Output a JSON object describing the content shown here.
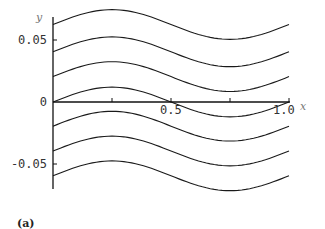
{
  "chart_data": {
    "type": "line",
    "title": "",
    "panel_label": "(a)",
    "xlabel": "x",
    "ylabel": "y",
    "xlim": [
      0,
      1.0
    ],
    "ylim": [
      -0.07,
      0.07
    ],
    "x_ticks": [
      {
        "value": 0.5,
        "label": "0.5"
      },
      {
        "value": 1.0,
        "label": "1.0"
      }
    ],
    "y_ticks": [
      {
        "value": 0.05,
        "label": "0.05"
      },
      {
        "value": 0,
        "label": "0"
      },
      {
        "value": -0.05,
        "label": "-0.05"
      }
    ],
    "grid": false,
    "legend": null,
    "series": [
      {
        "name": "curve-1",
        "y0": 0.0625,
        "x": [
          0,
          0.25,
          0.5,
          0.75,
          1.0
        ],
        "y": [
          0.0625,
          0.0745,
          0.0625,
          0.0505,
          0.0625
        ]
      },
      {
        "name": "curve-2",
        "y0": 0.0405,
        "x": [
          0,
          0.25,
          0.5,
          0.75,
          1.0
        ],
        "y": [
          0.0405,
          0.0525,
          0.0405,
          0.0285,
          0.0405
        ]
      },
      {
        "name": "curve-3",
        "y0": 0.0205,
        "x": [
          0,
          0.25,
          0.5,
          0.75,
          1.0
        ],
        "y": [
          0.0205,
          0.0325,
          0.0205,
          0.0085,
          0.0205
        ]
      },
      {
        "name": "curve-4",
        "y0": 0.0,
        "x": [
          0,
          0.25,
          0.5,
          0.75,
          1.0
        ],
        "y": [
          0.0,
          0.012,
          0.0,
          -0.012,
          0.0
        ]
      },
      {
        "name": "curve-5",
        "y0": -0.0195,
        "x": [
          0,
          0.25,
          0.5,
          0.75,
          1.0
        ],
        "y": [
          -0.0195,
          -0.0075,
          -0.0195,
          -0.0315,
          -0.0195
        ]
      },
      {
        "name": "curve-6",
        "y0": -0.0395,
        "x": [
          0,
          0.25,
          0.5,
          0.75,
          1.0
        ],
        "y": [
          -0.0395,
          -0.0275,
          -0.0395,
          -0.0515,
          -0.0395
        ]
      },
      {
        "name": "curve-7",
        "y0": -0.0595,
        "x": [
          0,
          0.25,
          0.5,
          0.75,
          1.0
        ],
        "y": [
          -0.0595,
          -0.0475,
          -0.0595,
          -0.0715,
          -0.0595
        ]
      }
    ]
  }
}
